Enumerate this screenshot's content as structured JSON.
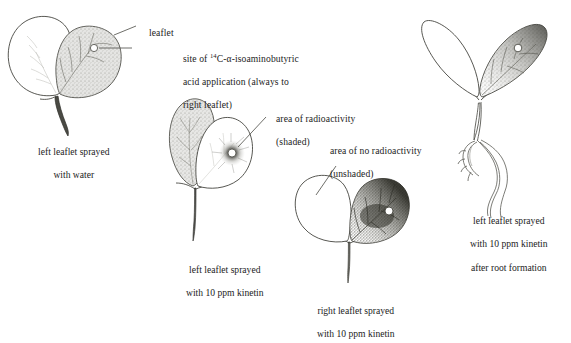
{
  "figure": {
    "kind": "botanical-illustration",
    "background_color": "#ffffff",
    "ink_color": "#1c1c1c",
    "shading_color": "#9a9a96"
  },
  "callouts": [
    {
      "id": "leaflet",
      "text": "leaflet"
    },
    {
      "id": "application-site",
      "line1_pre": "site of ",
      "line1_sup": "14",
      "line1_post": "C-α-isoaminobutyric",
      "line2": "acid application (always to",
      "line3": "right leaflet)"
    },
    {
      "id": "area-radioactivity",
      "line1": "area of radioactivity",
      "line2": "(shaded)"
    },
    {
      "id": "area-no-radioactivity",
      "line1": "area of no radioactivity",
      "line2": "(unshaded)"
    }
  ],
  "specimens": [
    {
      "id": "specimen-water",
      "caption_line1": "left leaflet sprayed",
      "caption_line2": "with water",
      "caption_line3": ""
    },
    {
      "id": "specimen-left-kinetin",
      "caption_line1": "left leaflet sprayed",
      "caption_line2": "with 10 ppm kinetin",
      "caption_line3": ""
    },
    {
      "id": "specimen-right-kinetin",
      "caption_line1": "right leaflet sprayed",
      "caption_line2": "with 10 ppm kinetin",
      "caption_line3": ""
    },
    {
      "id": "specimen-root-formation",
      "caption_line1": "left leaflet sprayed",
      "caption_line2": "with 10 ppm kinetin",
      "caption_line3": "after root formation"
    }
  ]
}
